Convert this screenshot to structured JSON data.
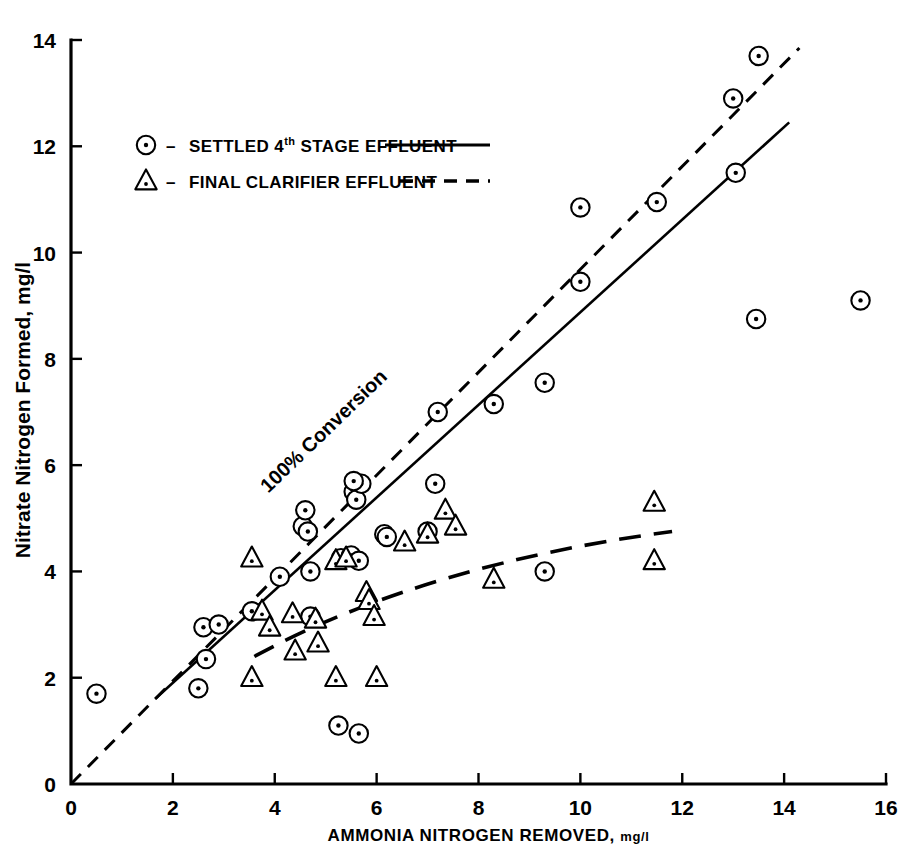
{
  "chart_data": {
    "type": "scatter",
    "title": "",
    "xlabel": "AMMONIA NITROGEN REMOVED, mg/l",
    "ylabel": "Nitrate Nitrogen Formed, mg/l",
    "xlim": [
      0,
      16
    ],
    "ylim": [
      0,
      14
    ],
    "xticks": [
      0,
      2,
      4,
      6,
      8,
      10,
      12,
      14,
      16
    ],
    "yticks": [
      0,
      2,
      4,
      6,
      8,
      10,
      12,
      14
    ],
    "grid": false,
    "legend_position": "upper-left-inside",
    "series": [
      {
        "name": "SETTLED 4th STAGE EFFLUENT",
        "marker": "circle-dot",
        "line": "solid",
        "points": [
          [
            0.5,
            1.7
          ],
          [
            2.5,
            1.8
          ],
          [
            2.6,
            2.95
          ],
          [
            2.9,
            3.0
          ],
          [
            2.65,
            2.35
          ],
          [
            3.55,
            3.25
          ],
          [
            4.1,
            3.9
          ],
          [
            4.55,
            4.85
          ],
          [
            4.6,
            5.15
          ],
          [
            4.65,
            4.75
          ],
          [
            4.7,
            4.0
          ],
          [
            4.7,
            3.15
          ],
          [
            5.25,
            1.1
          ],
          [
            5.65,
            0.95
          ],
          [
            5.3,
            4.25
          ],
          [
            5.5,
            4.3
          ],
          [
            5.65,
            4.2
          ],
          [
            5.55,
            5.5
          ],
          [
            5.6,
            5.35
          ],
          [
            5.7,
            5.65
          ],
          [
            5.55,
            5.7
          ],
          [
            6.15,
            4.7
          ],
          [
            6.2,
            4.65
          ],
          [
            7.0,
            4.75
          ],
          [
            7.15,
            5.65
          ],
          [
            7.2,
            7.0
          ],
          [
            8.3,
            7.15
          ],
          [
            9.3,
            7.55
          ],
          [
            9.3,
            4.0
          ],
          [
            10.0,
            10.85
          ],
          [
            10.0,
            9.45
          ],
          [
            11.5,
            10.95
          ],
          [
            13.0,
            12.9
          ],
          [
            13.05,
            11.5
          ],
          [
            13.5,
            13.7
          ],
          [
            13.45,
            8.75
          ],
          [
            15.5,
            9.1
          ]
        ]
      },
      {
        "name": "FINAL CLARIFIER EFFLUENT",
        "marker": "triangle-dot",
        "line": "dashed",
        "points": [
          [
            3.55,
            4.25
          ],
          [
            3.55,
            2.0
          ],
          [
            3.75,
            3.25
          ],
          [
            3.9,
            2.95
          ],
          [
            4.35,
            3.2
          ],
          [
            4.4,
            2.5
          ],
          [
            4.8,
            3.1
          ],
          [
            4.85,
            2.65
          ],
          [
            5.2,
            2.0
          ],
          [
            5.2,
            4.2
          ],
          [
            5.4,
            4.25
          ],
          [
            5.8,
            3.6
          ],
          [
            5.85,
            3.45
          ],
          [
            5.95,
            3.15
          ],
          [
            6.0,
            2.0
          ],
          [
            6.55,
            4.55
          ],
          [
            7.0,
            4.7
          ],
          [
            7.35,
            5.15
          ],
          [
            7.55,
            4.85
          ],
          [
            8.3,
            3.85
          ],
          [
            11.45,
            5.3
          ],
          [
            11.45,
            4.2
          ]
        ]
      }
    ],
    "fit_lines": [
      {
        "name": "100% Conversion",
        "style": "dashed",
        "from": [
          0.0,
          0.0
        ],
        "to": [
          14.3,
          13.85
        ]
      },
      {
        "name": "settled-4th-stage-fit",
        "style": "solid",
        "from": [
          1.65,
          1.6
        ],
        "to": [
          14.1,
          12.45
        ]
      },
      {
        "name": "final-clarifier-fit",
        "style": "dashed-curve",
        "from": [
          3.6,
          2.4
        ],
        "to": [
          11.8,
          4.75
        ]
      }
    ],
    "annotations": [
      {
        "text": "100% Conversion",
        "x": 5.05,
        "y": 6.55,
        "rotation": -44
      }
    ]
  },
  "legend": {
    "items": [
      {
        "marker": "circle-dot",
        "dash": "–",
        "label_pre": "SETTLED 4",
        "label_sup": "th",
        "label_post": " STAGE EFFLUENT",
        "line_style": "solid"
      },
      {
        "marker": "triangle-dot",
        "dash": "–",
        "label_pre": "FINAL CLARIFIER EFFLUENT",
        "label_sup": "",
        "label_post": "",
        "line_style": "dashed"
      }
    ]
  },
  "axes": {
    "x_title": "AMMONIA NITROGEN REMOVED,",
    "x_title_units": "mg/l",
    "y_title": "Nitrate Nitrogen Formed, mg/l",
    "x_tick_labels": [
      "0",
      "2",
      "4",
      "6",
      "8",
      "10",
      "12",
      "14",
      "16"
    ],
    "y_tick_labels": [
      "0",
      "2",
      "4",
      "6",
      "8",
      "10",
      "12",
      "14"
    ]
  },
  "colors": {
    "ink": "#000000",
    "paper": "#ffffff"
  }
}
